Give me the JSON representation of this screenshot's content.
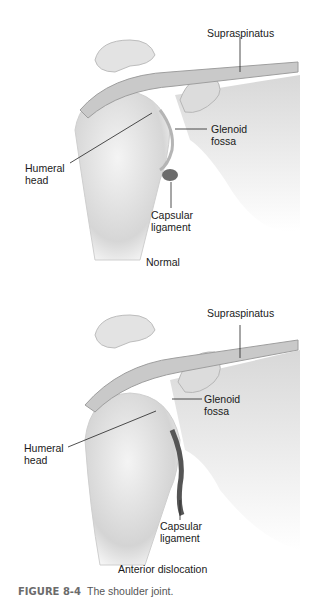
{
  "figure": {
    "number_label": "FIGURE 8-4",
    "title": "The shoulder joint."
  },
  "panels": [
    {
      "subtitle": "Normal",
      "labels": {
        "supraspinatus": "Supraspinatus",
        "glenoid": "Glenoid\nfossa",
        "humeral": "Humeral\nhead",
        "capsular": "Capsular\nligament"
      }
    },
    {
      "subtitle": "Anterior dislocation",
      "labels": {
        "supraspinatus": "Supraspinatus",
        "glenoid": "Glenoid\nfossa",
        "humeral": "Humeral\nhead",
        "capsular": "Capsular\nligament"
      }
    }
  ]
}
